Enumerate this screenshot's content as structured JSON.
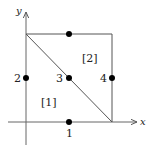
{
  "axes": {
    "x_label": "x",
    "y_label": "y"
  },
  "edges": [
    {
      "id": "1",
      "label": "1"
    },
    {
      "id": "2",
      "label": "2"
    },
    {
      "id": "3",
      "label": "3"
    },
    {
      "id": "4",
      "label": "4"
    }
  ],
  "regions": [
    {
      "id": "1",
      "label": "[1]"
    },
    {
      "id": "2",
      "label": "[2]"
    }
  ],
  "colors": {
    "line": "#555555",
    "point": "#000000",
    "background": "#ffffff"
  }
}
